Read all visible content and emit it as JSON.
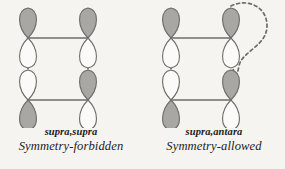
{
  "figure": {
    "background_color": "#f6f4f1",
    "lobe_shaded_color": "#a9a7a4",
    "lobe_empty_color": "#fbfaf8",
    "stroke_color": "#6e6c69",
    "text_color": "#1d1b19"
  },
  "panels": [
    {
      "id": "supra-supra",
      "mode_label": "supra,supra",
      "verdict_label": "Symmetry-forbidden",
      "interaction_path": "straight-vertical-dashed",
      "orbitals": [
        {
          "position": "top-left",
          "top_lobe": "shaded",
          "bottom_lobe": "empty"
        },
        {
          "position": "top-right",
          "top_lobe": "shaded",
          "bottom_lobe": "empty"
        },
        {
          "position": "bottom-left",
          "top_lobe": "empty",
          "bottom_lobe": "shaded"
        },
        {
          "position": "bottom-right",
          "top_lobe": "shaded",
          "bottom_lobe": "empty"
        }
      ],
      "bonds": [
        {
          "name": "upper-sigma-bond",
          "from": "top-left",
          "to": "top-right"
        },
        {
          "name": "lower-sigma-bond",
          "from": "bottom-left",
          "to": "bottom-right"
        }
      ],
      "dashed_links": [
        {
          "name": "left-overlap",
          "from": "top-left",
          "to": "bottom-left"
        },
        {
          "name": "right-overlap",
          "from": "top-right",
          "to": "bottom-right"
        }
      ]
    },
    {
      "id": "supra-antara",
      "mode_label": "supra,antara",
      "verdict_label": "Symmetry-allowed",
      "interaction_path": "curved-antarafacial-dashed",
      "orbitals": [
        {
          "position": "top-left",
          "top_lobe": "shaded",
          "bottom_lobe": "empty"
        },
        {
          "position": "top-right",
          "top_lobe": "shaded",
          "bottom_lobe": "empty"
        },
        {
          "position": "bottom-left",
          "top_lobe": "empty",
          "bottom_lobe": "shaded"
        },
        {
          "position": "bottom-right",
          "top_lobe": "shaded",
          "bottom_lobe": "empty"
        }
      ],
      "bonds": [
        {
          "name": "upper-sigma-bond",
          "from": "top-left",
          "to": "top-right"
        },
        {
          "name": "lower-sigma-bond",
          "from": "bottom-left",
          "to": "bottom-right"
        }
      ],
      "dashed_links": [
        {
          "name": "left-overlap",
          "from": "top-left",
          "to": "bottom-left"
        },
        {
          "name": "antarafacial-overlap",
          "from": "top-right",
          "to": "bottom-right"
        }
      ]
    }
  ]
}
